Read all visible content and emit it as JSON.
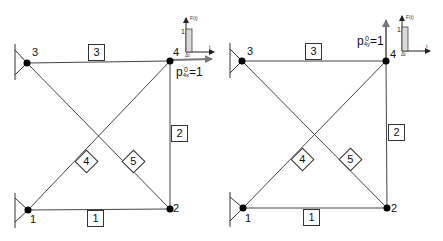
{
  "diagrams": [
    {
      "id": "left",
      "nodes": [
        {
          "label": "1",
          "x": 28,
          "y": 210
        },
        {
          "label": "2",
          "x": 170,
          "y": 209
        },
        {
          "label": "3",
          "x": 27,
          "y": 63
        },
        {
          "label": "4",
          "x": 170,
          "y": 61
        }
      ],
      "members": [
        {
          "label": "1",
          "from": "1",
          "to": "2"
        },
        {
          "label": "2",
          "from": "2",
          "to": "4"
        },
        {
          "label": "3",
          "from": "3",
          "to": "4"
        },
        {
          "label": "4",
          "from": "1",
          "to": "4"
        },
        {
          "label": "5",
          "from": "3",
          "to": "2"
        }
      ],
      "load": {
        "symbol": "p",
        "superscript": "0",
        "subscript": "4x",
        "value": "=1",
        "direction": "x"
      },
      "force_plot": {
        "y_label": "F(t)",
        "x_label": "t",
        "y_tick": "1",
        "x_tick": "Δt"
      }
    },
    {
      "id": "right",
      "nodes": [
        {
          "label": "1",
          "x": 243,
          "y": 208
        },
        {
          "label": "2",
          "x": 387,
          "y": 208
        },
        {
          "label": "3",
          "x": 242,
          "y": 61
        },
        {
          "label": "4",
          "x": 386,
          "y": 61
        }
      ],
      "members": [
        {
          "label": "1",
          "from": "1",
          "to": "2"
        },
        {
          "label": "2",
          "from": "2",
          "to": "4"
        },
        {
          "label": "3",
          "from": "3",
          "to": "4"
        },
        {
          "label": "4",
          "from": "1",
          "to": "4"
        },
        {
          "label": "5",
          "from": "3",
          "to": "2"
        }
      ],
      "load": {
        "symbol": "p",
        "superscript": "0",
        "subscript": "4y",
        "value": "=1",
        "direction": "y"
      },
      "force_plot": {
        "y_label": "F(t)",
        "x_label": "t",
        "y_tick": "1",
        "x_tick": "Δt"
      }
    }
  ],
  "colors": {
    "line": "#333333",
    "node": "#000000",
    "arrow": "#777777",
    "pulse_fill": "#d9d9d9"
  }
}
